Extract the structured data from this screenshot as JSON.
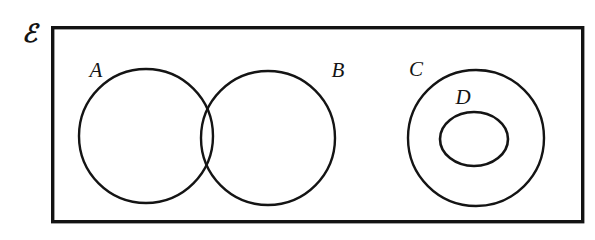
{
  "diagram": {
    "kind": "venn-diagram",
    "universe": {
      "label": "ℰ",
      "label_name": "universal-set-symbol",
      "box": {
        "x": 51,
        "y": 26,
        "width": 533,
        "height": 197
      },
      "stroke_color": "#131313"
    },
    "background_color": "#ffffff",
    "stroke_color": "#141414",
    "sets": [
      {
        "id": "A",
        "label": "A",
        "shape": "circle",
        "cx": 146,
        "cy": 136,
        "r": 67,
        "label_x": 96,
        "label_y": 77
      },
      {
        "id": "B",
        "label": "B",
        "shape": "circle",
        "cx": 268,
        "cy": 138,
        "r": 67,
        "label_x": 338,
        "label_y": 77
      },
      {
        "id": "C",
        "label": "C",
        "shape": "circle",
        "cx": 476,
        "cy": 138,
        "r": 68,
        "label_x": 416,
        "label_y": 76
      },
      {
        "id": "D",
        "label": "D",
        "shape": "ellipse",
        "cx": 474,
        "cy": 139,
        "rx": 34,
        "ry": 27,
        "label_x": 463,
        "label_y": 104
      }
    ],
    "relations": [
      "A and B intersect",
      "D is a subset of C",
      "A, B, C, D are all inside the universal set"
    ]
  }
}
